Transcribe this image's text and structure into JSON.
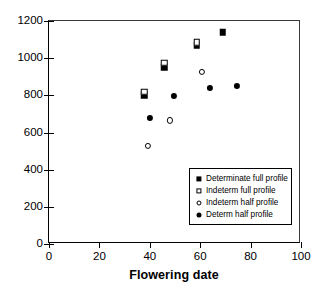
{
  "chart_data": {
    "type": "scatter",
    "title": "",
    "xlabel": "Flowering date",
    "ylabel": "",
    "xlim": [
      0,
      100
    ],
    "ylim": [
      0,
      1200
    ],
    "xticks": [
      0,
      20,
      40,
      60,
      80,
      100
    ],
    "yticks": [
      0,
      200,
      400,
      600,
      800,
      1000,
      1200
    ],
    "grid": false,
    "legend_position": "lower right",
    "series": [
      {
        "name": "Determinate full profile",
        "marker": "filled-square",
        "color": "#000000",
        "points": [
          {
            "x": 37.7,
            "y": 800
          },
          {
            "x": 45.8,
            "y": 950
          },
          {
            "x": 58.7,
            "y": 1070
          },
          {
            "x": 69.0,
            "y": 1140
          }
        ]
      },
      {
        "name": "Indeterm full profile",
        "marker": "open-square",
        "color": "#000000",
        "points": [
          {
            "x": 37.7,
            "y": 820
          },
          {
            "x": 45.8,
            "y": 975
          },
          {
            "x": 58.7,
            "y": 1085
          }
        ]
      },
      {
        "name": "Indeterm half profile",
        "marker": "open-circle",
        "color": "#000000",
        "points": [
          {
            "x": 39.3,
            "y": 530
          },
          {
            "x": 48.0,
            "y": 665
          },
          {
            "x": 60.7,
            "y": 925
          }
        ]
      },
      {
        "name": "Determ half profile",
        "marker": "filled-circle",
        "color": "#000000",
        "points": [
          {
            "x": 40.0,
            "y": 678
          },
          {
            "x": 49.6,
            "y": 795
          },
          {
            "x": 63.9,
            "y": 840
          },
          {
            "x": 74.6,
            "y": 850
          }
        ]
      }
    ]
  },
  "axis": {
    "x": {
      "title": "Flowering date",
      "ticklabels": [
        "0",
        "20",
        "40",
        "60",
        "80",
        "100"
      ]
    },
    "y": {
      "title": "",
      "ticklabels": [
        "0",
        "200",
        "400",
        "600",
        "800",
        "1000",
        "1200"
      ]
    }
  },
  "legend": {
    "entries": [
      {
        "label": "Determinate full profile",
        "marker": "filled-square"
      },
      {
        "label": "Indeterm full profile",
        "marker": "open-square"
      },
      {
        "label": "Indeterm half profile",
        "marker": "open-circle"
      },
      {
        "label": "Determ half profile",
        "marker": "filled-circle"
      }
    ]
  }
}
